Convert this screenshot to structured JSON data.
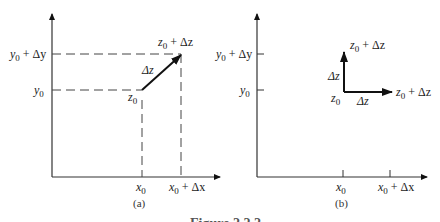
{
  "figure": {
    "panels": [
      {
        "id": "a",
        "caption": "(a)",
        "y_ticks": [
          {
            "label_main": "y",
            "label_sub": "0",
            "label_rest": " + Δy",
            "plain": "y0 + Δy"
          },
          {
            "label_main": "y",
            "label_sub": "0",
            "label_rest": "",
            "plain": "y0"
          }
        ],
        "x_ticks": [
          {
            "label_main": "x",
            "label_sub": "0",
            "label_rest": "",
            "plain": "x0"
          },
          {
            "label_main": "x",
            "label_sub": "0",
            "label_rest": " + Δx",
            "plain": "x0 + Δx"
          }
        ],
        "start_point": {
          "main": "z",
          "sub": "0",
          "plain": "z0"
        },
        "end_point": {
          "main": "z",
          "sub": "0",
          "rest": " + Δz",
          "plain": "z0 + Δz"
        },
        "vector_label": "Δz"
      },
      {
        "id": "b",
        "caption": "(b)",
        "y_ticks": [
          {
            "label_main": "y",
            "label_sub": "0",
            "label_rest": " + Δy",
            "plain": "y0 + Δy"
          },
          {
            "label_main": "y",
            "label_sub": "0",
            "label_rest": "",
            "plain": "y0"
          }
        ],
        "x_ticks": [
          {
            "label_main": "x",
            "label_sub": "0",
            "label_rest": "",
            "plain": "x0"
          },
          {
            "label_main": "x",
            "label_sub": "0",
            "label_rest": " + Δx",
            "plain": "x0 + Δx"
          }
        ],
        "origin_point": {
          "main": "z",
          "sub": "0",
          "plain": "z0"
        },
        "vertical_end": {
          "main": "z",
          "sub": "0",
          "rest": " + Δz",
          "plain": "z0 + Δz"
        },
        "horizontal_end": {
          "main": "z",
          "sub": "0",
          "rest": " + Δz",
          "plain": "z0 + Δz"
        },
        "vertical_label": "Δz",
        "horizontal_label": "Δz"
      }
    ],
    "figure_caption_partial": "Figure 2.2.2"
  }
}
